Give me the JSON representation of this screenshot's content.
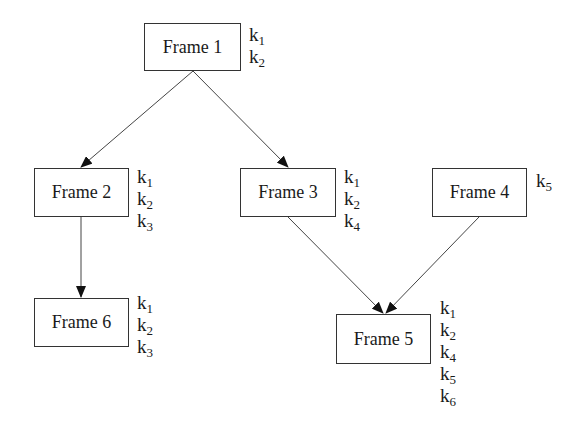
{
  "frames": [
    {
      "id": "f1",
      "label": "Frame 1",
      "keys": [
        {
          "base": "k",
          "sub": "1"
        },
        {
          "base": "k",
          "sub": "2"
        }
      ]
    },
    {
      "id": "f2",
      "label": "Frame 2",
      "keys": [
        {
          "base": "k",
          "sub": "1"
        },
        {
          "base": "k",
          "sub": "2"
        },
        {
          "base": "k",
          "sub": "3"
        }
      ]
    },
    {
      "id": "f3",
      "label": "Frame 3",
      "keys": [
        {
          "base": "k",
          "sub": "1"
        },
        {
          "base": "k",
          "sub": "2"
        },
        {
          "base": "k",
          "sub": "4"
        }
      ]
    },
    {
      "id": "f4",
      "label": "Frame 4",
      "keys": [
        {
          "base": "k",
          "sub": "5"
        }
      ]
    },
    {
      "id": "f5",
      "label": "Frame 5",
      "keys": [
        {
          "base": "k",
          "sub": "1"
        },
        {
          "base": "k",
          "sub": "2"
        },
        {
          "base": "k",
          "sub": "4"
        },
        {
          "base": "k",
          "sub": "5"
        },
        {
          "base": "k",
          "sub": "6"
        }
      ]
    },
    {
      "id": "f6",
      "label": "Frame 6",
      "keys": [
        {
          "base": "k",
          "sub": "1"
        },
        {
          "base": "k",
          "sub": "2"
        },
        {
          "base": "k",
          "sub": "3"
        }
      ]
    }
  ],
  "edges": [
    {
      "from": "Frame 1",
      "to": "Frame 2"
    },
    {
      "from": "Frame 1",
      "to": "Frame 3"
    },
    {
      "from": "Frame 2",
      "to": "Frame 6"
    },
    {
      "from": "Frame 3",
      "to": "Frame 5"
    },
    {
      "from": "Frame 4",
      "to": "Frame 5"
    }
  ]
}
